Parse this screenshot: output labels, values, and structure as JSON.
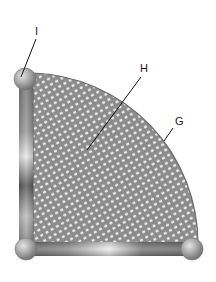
{
  "diagram": {
    "labels": [
      {
        "id": "I",
        "text": "I",
        "target": "ball-joint"
      },
      {
        "id": "H",
        "text": "H",
        "target": "mesh-panel"
      },
      {
        "id": "G",
        "text": "G",
        "target": "curved-edge"
      }
    ],
    "colors": {
      "mesh": "#8a8a8a",
      "mesh_holes": "#f2f2f2",
      "frame_dark": "#6e6e6e",
      "frame_light": "#e0e0e0",
      "ball": "#a6a6a6",
      "leader": "#111111"
    }
  }
}
